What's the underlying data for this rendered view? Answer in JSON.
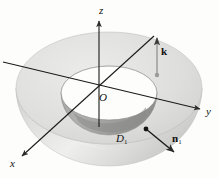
{
  "figure": {
    "kind": "3d-geometry-diagram",
    "background_color": "#fdfdfc",
    "line_color": "#1a1a1a"
  },
  "axes": {
    "z": {
      "label": "z",
      "direction": "up",
      "has_arrow": true
    },
    "y": {
      "label": "y",
      "direction": "right",
      "has_arrow": true
    },
    "x": {
      "label": "x",
      "direction": "lower-left",
      "has_arrow": true
    },
    "origin": {
      "label": "O"
    }
  },
  "vectors": {
    "k": {
      "label": "k",
      "style": "bold",
      "direction": "up",
      "description": "vertical unit vector on top annular face"
    },
    "n1": {
      "label": "n",
      "subscript": "1",
      "style": "bold",
      "direction": "outward-lower-right",
      "description": "outward unit normal on outer hemisphere surface"
    }
  },
  "regions": {
    "D1": {
      "label": "D",
      "subscript": "1",
      "style": "italic",
      "description": "outer hemispherical solid region"
    }
  },
  "solid": {
    "outer_surface_color": "#d8d8d6",
    "outer_highlight_color": "#efefed",
    "top_face_color": "#e2e2e0",
    "inner_cavity_color": "#a8a8a6",
    "inner_cavity_shadow": "#8f8f8d"
  }
}
